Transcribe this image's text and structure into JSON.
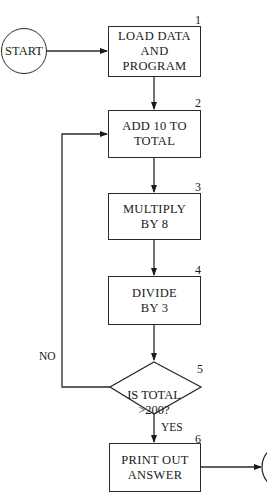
{
  "flowchart": {
    "start": {
      "label": "START"
    },
    "steps": [
      {
        "number": "1",
        "label": "LOAD DATA\nAND\nPROGRAM"
      },
      {
        "number": "2",
        "label": "ADD 10 TO\nTOTAL"
      },
      {
        "number": "3",
        "label": "MULTIPLY\nBY 8"
      },
      {
        "number": "4",
        "label": "DIVIDE\nBY 3"
      },
      {
        "number": "5",
        "label": "IS TOTAL\n>200?"
      },
      {
        "number": "6",
        "label": "PRINT OUT\nANSWER"
      }
    ],
    "branches": {
      "no": "NO",
      "yes": "YES"
    }
  }
}
